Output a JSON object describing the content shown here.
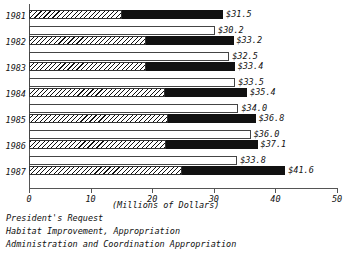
{
  "chart_data": {
    "type": "bar",
    "orientation": "horizontal",
    "title": "",
    "xlabel": "(Millions of Dollars)",
    "ylabel": "",
    "xlim": [
      0,
      50
    ],
    "xticks": [
      0,
      10,
      20,
      30,
      40,
      50
    ],
    "xticklabels": [
      "0",
      "10",
      "20",
      "30",
      "40",
      "50"
    ],
    "grid": false,
    "legend_position": "below-left",
    "categories": [
      "1981",
      "1982",
      "1983",
      "1984",
      "1985",
      "1986",
      "1987"
    ],
    "series": [
      {
        "name": "President's Request",
        "style": "white-outline",
        "values": [
          null,
          30.2,
          32.5,
          33.5,
          34.0,
          36.0,
          33.8
        ],
        "labels": [
          "",
          "$30.2",
          "$32.5",
          "$33.5",
          "$34.0",
          "$36.0",
          "$33.8"
        ]
      },
      {
        "name": "Habitat Improvement, Appropriation",
        "style": "hatched",
        "values": [
          15.1,
          19.0,
          19.0,
          22.0,
          22.5,
          22.3,
          24.8
        ]
      },
      {
        "name": "Administration and Coordination Appropriation",
        "style": "solid-black",
        "values": [
          16.4,
          14.2,
          14.4,
          13.4,
          14.3,
          14.8,
          16.8
        ]
      }
    ],
    "stacked_totals": [
      31.5,
      33.2,
      33.4,
      35.4,
      36.8,
      37.1,
      41.6
    ],
    "stacked_total_labels": [
      "$31.5",
      "$33.2",
      "$33.4",
      "$35.4",
      "$36.8",
      "$37.1",
      "$41.6"
    ]
  },
  "legend": {
    "items": [
      "President's Request",
      "Habitat Improvement, Appropriation",
      "Administration and Coordination Appropriation"
    ]
  },
  "colors": {
    "axis": "#555555",
    "hatch": "#111111",
    "solid": "#111111",
    "background": "#ffffff"
  }
}
